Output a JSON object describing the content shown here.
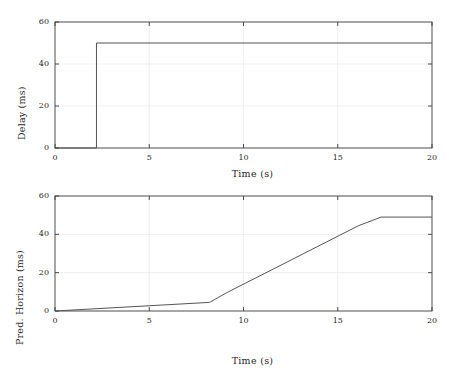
{
  "figure": {
    "background": "#ffffff",
    "line_color": "#555555",
    "axis_color": "#3a3a3a",
    "grid_color": "#ebebeb",
    "text_color": "#1f1f1f"
  },
  "chart_data": [
    {
      "type": "line",
      "id": "delay-panel",
      "title": "",
      "xlabel": "Time (s)",
      "ylabel": "Delay (ms)",
      "xlim": [
        0,
        20
      ],
      "ylim": [
        0,
        60
      ],
      "xticks": [
        0,
        5,
        10,
        15,
        20
      ],
      "xticklabels": [
        "0",
        "5",
        "10",
        "15",
        "20"
      ],
      "yticks": [
        0,
        20,
        40,
        60
      ],
      "yticklabels": [
        "0",
        "20",
        "40",
        "60"
      ],
      "grid": true,
      "drawstyle": "steps-post",
      "series": [
        {
          "name": "Delay",
          "x": [
            0,
            2.2,
            2.2,
            20
          ],
          "y": [
            0,
            0,
            50,
            50
          ]
        }
      ]
    },
    {
      "type": "line",
      "id": "horizon-panel",
      "title": "",
      "xlabel": "Time (s)",
      "ylabel": "Pred. Horizon (ms)",
      "xlim": [
        0,
        20
      ],
      "ylim": [
        0,
        60
      ],
      "xticks": [
        0,
        5,
        10,
        15,
        20
      ],
      "xticklabels": [
        "0",
        "5",
        "10",
        "15",
        "20"
      ],
      "yticks": [
        0,
        20,
        40,
        60
      ],
      "yticklabels": [
        "0",
        "20",
        "40",
        "60"
      ],
      "grid": true,
      "drawstyle": "steps-post",
      "series": [
        {
          "name": "Pred. Horizon",
          "x": [
            0,
            8.2,
            9.1,
            10.1,
            11.1,
            12.1,
            13.1,
            14.1,
            15.1,
            16.1,
            17.3,
            20
          ],
          "y": [
            0,
            4.5,
            9.5,
            14.5,
            19.5,
            24.5,
            29.5,
            34.5,
            39.5,
            44.5,
            49,
            49
          ]
        }
      ]
    }
  ]
}
